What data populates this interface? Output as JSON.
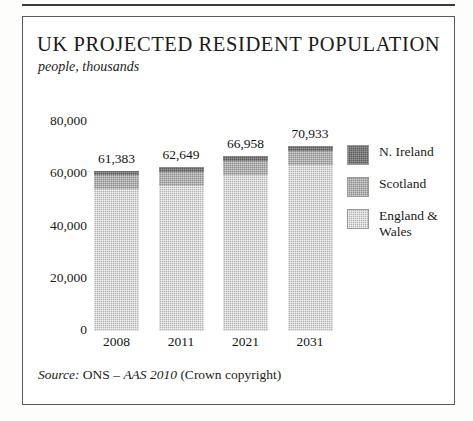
{
  "figure": {
    "title": "UK PROJECTED RESIDENT POPULATION",
    "subtitle": "people, thousands",
    "source_prefix": "Source:",
    "source_body": " ONS – ",
    "source_italic": "AAS 2010",
    "source_suffix": " (Crown copyright)"
  },
  "legend": {
    "items": [
      {
        "label": "N. Ireland",
        "color": "#5c5c5c"
      },
      {
        "label": "Scotland",
        "color": "#8e8e8e"
      },
      {
        "label": "England & Wales",
        "color": "#b4b4b4"
      }
    ]
  },
  "chart_data": {
    "type": "bar",
    "subtype": "stacked-vertical",
    "title": "UK PROJECTED RESIDENT POPULATION",
    "subtitle": "people, thousands",
    "xlabel": "",
    "ylabel": "people, thousands",
    "ylim": [
      0,
      80000
    ],
    "yticks": [
      0,
      20000,
      40000,
      60000,
      80000
    ],
    "ytick_labels": [
      "0",
      "20,000",
      "40,000",
      "60,000",
      "80,000"
    ],
    "grid": false,
    "legend_position": "right",
    "categories": [
      "2008",
      "2011",
      "2021",
      "2031"
    ],
    "totals": [
      61383,
      62649,
      66958,
      70933
    ],
    "total_labels": [
      "61,383",
      "62,649",
      "66,958",
      "70,933"
    ],
    "series": [
      {
        "name": "England & Wales",
        "color": "#b4b4b4",
        "values": [
          54454,
          55573,
          59662,
          63466
        ]
      },
      {
        "name": "Scotland",
        "color": "#8e8e8e",
        "values": [
          5169,
          5222,
          5425,
          5611
        ]
      },
      {
        "name": "N. Ireland",
        "color": "#5c5c5c",
        "values": [
          1760,
          1854,
          1871,
          1856
        ]
      }
    ],
    "source": "Source: ONS – AAS 2010 (Crown copyright)"
  }
}
